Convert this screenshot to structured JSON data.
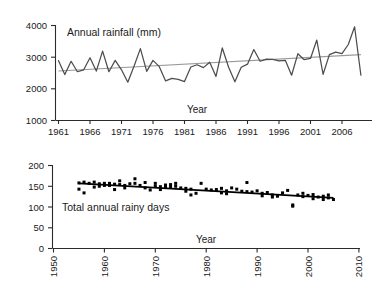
{
  "figure": {
    "background": "#ffffff",
    "line_color": "#4d4d4d",
    "trend_color_top": "#9a9a9a",
    "trend_color_bottom": "#000000",
    "marker_color": "#000000"
  },
  "panels": {
    "top": {
      "series_label": "Annual rainfall (mm)",
      "xlabel": "Year",
      "y_ticks": [
        "1000",
        "2000",
        "3000",
        "4000"
      ],
      "x_ticks": [
        "1961",
        "1966",
        "1971",
        "1976",
        "1981",
        "1986",
        "1991",
        "1996",
        "2001",
        "2006"
      ]
    },
    "bottom": {
      "series_label": "Total annual rainy days",
      "xlabel": "Year",
      "y_ticks": [
        "0",
        "50",
        "100",
        "150",
        "200"
      ],
      "x_ticks": [
        "1950",
        "1960",
        "1970",
        "1980",
        "1990",
        "2000",
        "2010"
      ]
    }
  },
  "chart_data": [
    {
      "type": "line",
      "title": "Annual rainfall (mm)",
      "xlabel": "Year",
      "ylabel": "Annual rainfall (mm)",
      "xlim": [
        1961,
        2009
      ],
      "ylim": [
        1000,
        4000
      ],
      "grid": false,
      "legend": "none",
      "x_tick_labels": [
        "1961",
        "1966",
        "1971",
        "1976",
        "1981",
        "1986",
        "1991",
        "1996",
        "2001",
        "2006"
      ],
      "y_tick_labels": [
        "1000",
        "2000",
        "3000",
        "4000"
      ],
      "annotations": [
        "Annual rainfall (mm)",
        "Year"
      ],
      "x": [
        1961,
        1962,
        1963,
        1964,
        1965,
        1966,
        1967,
        1968,
        1969,
        1970,
        1971,
        1972,
        1973,
        1974,
        1975,
        1976,
        1977,
        1978,
        1979,
        1980,
        1981,
        1982,
        1983,
        1984,
        1985,
        1986,
        1987,
        1988,
        1989,
        1990,
        1991,
        1992,
        1993,
        1994,
        1995,
        1996,
        1997,
        1998,
        1999,
        2000,
        2001,
        2002,
        2003,
        2004,
        2005,
        2006,
        2007,
        2008,
        2009
      ],
      "values": [
        2890,
        2450,
        2870,
        2540,
        2600,
        2980,
        2560,
        3190,
        2540,
        2900,
        2600,
        2210,
        2720,
        3270,
        2550,
        2900,
        2700,
        2250,
        2330,
        2300,
        2230,
        2690,
        2760,
        2670,
        2840,
        2390,
        3290,
        2680,
        2220,
        2680,
        2780,
        3240,
        2870,
        2940,
        2930,
        2880,
        2900,
        2430,
        3110,
        2920,
        2960,
        3540,
        2460,
        3080,
        3160,
        3110,
        3400,
        3960,
        2430
      ],
      "series": [
        {
          "name": "Annual rainfall",
          "kind": "line",
          "color": "#4d4d4d"
        },
        {
          "name": "Linear trend",
          "kind": "trend",
          "color": "#9a9a9a",
          "start": [
            1961,
            2565
          ],
          "end": [
            2009,
            3080
          ]
        }
      ]
    },
    {
      "type": "scatter",
      "title": "Total annual rainy days",
      "xlabel": "Year",
      "ylabel": "Total annual rainy days",
      "xlim": [
        1950,
        2010
      ],
      "ylim": [
        0,
        200
      ],
      "grid": false,
      "legend": "none",
      "x_tick_labels": [
        "1950",
        "1960",
        "1970",
        "1980",
        "1990",
        "2000",
        "2010"
      ],
      "y_tick_labels": [
        "0",
        "50",
        "100",
        "150",
        "200"
      ],
      "annotations": [
        "Total annual rainy days",
        "Year"
      ],
      "x": [
        1955,
        1955,
        1956,
        1956,
        1957,
        1958,
        1958,
        1959,
        1959,
        1960,
        1960,
        1961,
        1961,
        1962,
        1962,
        1963,
        1963,
        1964,
        1964,
        1965,
        1966,
        1966,
        1967,
        1968,
        1968,
        1969,
        1970,
        1970,
        1971,
        1971,
        1972,
        1972,
        1973,
        1973,
        1974,
        1974,
        1975,
        1976,
        1976,
        1977,
        1977,
        1978,
        1979,
        1980,
        1981,
        1982,
        1983,
        1983,
        1984,
        1984,
        1985,
        1986,
        1987,
        1988,
        1988,
        1989,
        1990,
        1991,
        1991,
        1992,
        1993,
        1993,
        1994,
        1995,
        1996,
        1997,
        1997,
        1998,
        1999,
        1999,
        2000,
        2001,
        2001,
        2002,
        2003,
        2003,
        2004,
        2004,
        2005
      ],
      "values": [
        158,
        143,
        160,
        134,
        157,
        160,
        148,
        156,
        150,
        157,
        152,
        157,
        152,
        155,
        142,
        163,
        154,
        152,
        146,
        156,
        168,
        157,
        152,
        159,
        146,
        141,
        157,
        150,
        149,
        142,
        153,
        147,
        154,
        148,
        157,
        150,
        146,
        145,
        138,
        143,
        129,
        133,
        157,
        143,
        141,
        142,
        145,
        134,
        139,
        132,
        146,
        143,
        138,
        159,
        137,
        136,
        139,
        133,
        127,
        135,
        129,
        124,
        126,
        134,
        140,
        102,
        105,
        129,
        133,
        125,
        128,
        130,
        120,
        124,
        126,
        118,
        129,
        122,
        118
      ],
      "series": [
        {
          "name": "Total annual rainy days",
          "kind": "scatter",
          "color": "#000000"
        },
        {
          "name": "Linear trend",
          "kind": "trend",
          "color": "#000000",
          "start": [
            1955,
            157
          ],
          "end": [
            2005,
            122
          ]
        }
      ]
    }
  ]
}
